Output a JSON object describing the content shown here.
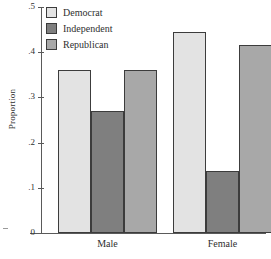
{
  "chart_data": {
    "type": "bar",
    "title": "",
    "xlabel": "",
    "ylabel": "Proportion",
    "categories": [
      "Male",
      "Female"
    ],
    "series": [
      {
        "name": "Democrat",
        "values": [
          0.36,
          0.445
        ],
        "color": "#e3e3e3"
      },
      {
        "name": "Independent",
        "values": [
          0.27,
          0.137
        ],
        "color": "#7f7f7f"
      },
      {
        "name": "Republican",
        "values": [
          0.36,
          0.415
        ],
        "color": "#a8a8a8"
      }
    ],
    "ylim": [
      0,
      0.5
    ],
    "yticks": [
      0,
      0.1,
      0.2,
      0.3,
      0.4,
      0.5
    ],
    "ytick_labels": [
      "0",
      ".1",
      ".2",
      ".3",
      ".4",
      ".5"
    ],
    "grid": false,
    "legend_position": "top-left",
    "bar_edge_color": "#3c3c3c",
    "axis_color": "#5a5a5a"
  },
  "legend": {
    "items": [
      {
        "label": "Democrat"
      },
      {
        "label": "Independent"
      },
      {
        "label": "Republican"
      }
    ]
  },
  "axis": {
    "y_label": "Proportion",
    "y_ticks": [
      {
        "label": ".5"
      },
      {
        "label": ".4"
      },
      {
        "label": ".3"
      },
      {
        "label": ".2"
      },
      {
        "label": ".1"
      },
      {
        "label": "0"
      }
    ],
    "x_categories": [
      {
        "label": "Male"
      },
      {
        "label": "Female"
      }
    ]
  }
}
